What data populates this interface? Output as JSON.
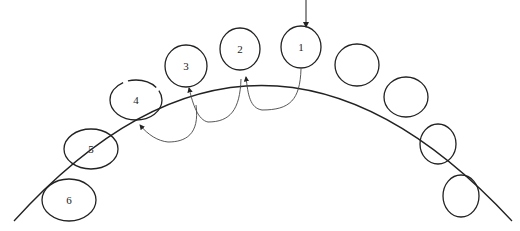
{
  "diagram": {
    "arch": {
      "path": "M 14 221 Q 260 -50 512 221"
    },
    "entry_arrow": {
      "x": 306,
      "y1": 0,
      "y2": 27
    },
    "teeth": [
      {
        "label": "1",
        "cx": 301,
        "cy": 47,
        "rx": 20,
        "ry": 21
      },
      {
        "label": "2",
        "cx": 240,
        "cy": 49,
        "rx": 20,
        "ry": 21
      },
      {
        "label": "3",
        "cx": 186,
        "cy": 66,
        "rx": 21,
        "ry": 21
      },
      {
        "label": "4",
        "cx": 136,
        "cy": 100,
        "rx": 26,
        "ry": 20
      },
      {
        "label": "5",
        "cx": 91,
        "cy": 149,
        "rx": 27,
        "ry": 20
      },
      {
        "label": "6",
        "cx": 69,
        "cy": 200,
        "rx": 27,
        "ry": 21
      },
      {
        "label": "",
        "cx": 357,
        "cy": 65,
        "rx": 22,
        "ry": 21
      },
      {
        "label": "",
        "cx": 406,
        "cy": 97,
        "rx": 22,
        "ry": 20
      },
      {
        "label": "",
        "cx": 438,
        "cy": 144,
        "rx": 18,
        "ry": 20
      },
      {
        "label": "",
        "cx": 461,
        "cy": 196,
        "rx": 18,
        "ry": 21
      }
    ],
    "arrows": [
      {
        "from": "1",
        "to": "2",
        "path": "M 301 69 C 300 100 290 110 262 110 C 250 108 248 95 246 77"
      },
      {
        "from": "2",
        "to": "3",
        "path": "M 241 79 C 240 110 230 122 208 122 C 198 120 193 105 189 88"
      },
      {
        "from": "3",
        "to": "4",
        "path": "M 196 105 C 200 135 185 142 168 142 C 158 141 148 135 140 125"
      }
    ]
  }
}
